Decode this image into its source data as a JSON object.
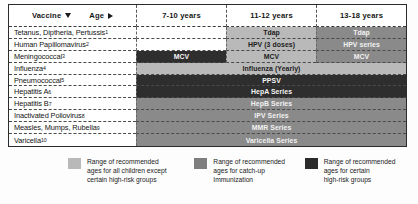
{
  "table": {
    "header": {
      "vaccine_label": "Vaccine",
      "vaccine_sort_icon": "triangle-down-icon",
      "age_label": "Age",
      "age_sort_icon": "triangle-right-icon",
      "age_columns": [
        "7-10 years",
        "11-12 years",
        "13-18 years"
      ]
    },
    "rows": [
      {
        "vaccine": "Tetanus, Diptheria, Pertussis",
        "footnote": "1",
        "full_span": false,
        "cells": [
          {
            "label": "",
            "shade": "empty"
          },
          {
            "label": "Tdap",
            "shade": "light"
          },
          {
            "label": "Tdap",
            "shade": "mid"
          }
        ]
      },
      {
        "vaccine": "Human Papillomavirus",
        "footnote": "2",
        "full_span": false,
        "cells": [
          {
            "label": "",
            "shade": "empty"
          },
          {
            "label": "HPV (3 doses)",
            "shade": "light"
          },
          {
            "label": "HPV series",
            "shade": "mid"
          }
        ]
      },
      {
        "vaccine": "Meningococcal",
        "footnote": "3",
        "full_span": false,
        "cells": [
          {
            "label": "MCV",
            "shade": "dark"
          },
          {
            "label": "MCV",
            "shade": "light"
          },
          {
            "label": "MCV",
            "shade": "mid"
          }
        ]
      },
      {
        "vaccine": "Influenza",
        "footnote": "4",
        "full_span": true,
        "span_label": "Influenza (Yearly)",
        "span_shade": "light"
      },
      {
        "vaccine": "Pneumococcal",
        "footnote": "5",
        "full_span": true,
        "span_label": "PPSV",
        "span_shade": "dark"
      },
      {
        "vaccine": "Hepatitis A",
        "footnote": "6",
        "full_span": true,
        "span_label": "HepA Series",
        "span_shade": "dark"
      },
      {
        "vaccine": "Hepatitis B",
        "footnote": "7",
        "full_span": true,
        "span_label": "HepB Series",
        "span_shade": "mid"
      },
      {
        "vaccine": "Inactivated Poliovirus",
        "footnote": "8",
        "full_span": true,
        "span_label": "IPV Series",
        "span_shade": "mid"
      },
      {
        "vaccine": "Measles, Mumps, Rubella",
        "footnote": "9",
        "full_span": true,
        "span_label": "MMR Series",
        "span_shade": "mid"
      },
      {
        "vaccine": "Varicella",
        "footnote": "10",
        "full_span": true,
        "span_label": "Varicella Series",
        "span_shade": "mid"
      }
    ]
  },
  "legend": {
    "items": [
      {
        "shade": "light",
        "color": "#b9b9b9",
        "lines": [
          "Range of recommended",
          "ages for all children except",
          "certain high-risk groups"
        ]
      },
      {
        "shade": "mid",
        "color": "#7e7e7e",
        "lines": [
          "Range of recommended",
          "ages for catch-up",
          "Immunization"
        ]
      },
      {
        "shade": "dark",
        "color": "#2b2b2b",
        "lines": [
          "Range of recommended",
          "ages for certain",
          "high-risk groups"
        ]
      }
    ]
  }
}
